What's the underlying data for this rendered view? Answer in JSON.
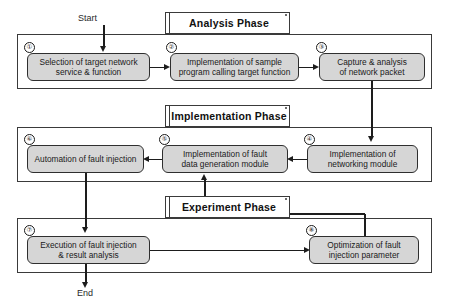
{
  "diagram": {
    "terminals": {
      "start": "Start",
      "end": "End"
    },
    "colors": {
      "box_fill": "#d6d6d6",
      "box_border": "#2f2f2f",
      "frame_border": "#3a3a3a",
      "connector": "#1d1d1d",
      "plaque_fill": "#ffffff",
      "text": "#1a1a1a"
    },
    "phases": [
      {
        "id": "analysis",
        "label": "Analysis Phase"
      },
      {
        "id": "implementation",
        "label": "Implementation Phase"
      },
      {
        "id": "experiment",
        "label": "Experiment Phase"
      }
    ],
    "steps": [
      {
        "number": "①",
        "phase": "analysis",
        "line1": "Selection of target network",
        "line2": "service & function"
      },
      {
        "number": "②",
        "phase": "analysis",
        "line1": "Implementation of sample",
        "line2": "program calling target function"
      },
      {
        "number": "③",
        "phase": "analysis",
        "line1": "Capture & analysis",
        "line2": "of network packet"
      },
      {
        "number": "④",
        "phase": "implementation",
        "line1": "Implementation of",
        "line2": "networking module"
      },
      {
        "number": "⑤",
        "phase": "implementation",
        "line1": "Implementation of fault",
        "line2": "data generation module"
      },
      {
        "number": "⑥",
        "phase": "implementation",
        "line1": "Automation of fault injection",
        "line2": ""
      },
      {
        "number": "⑦",
        "phase": "experiment",
        "line1": "Execution of fault injection",
        "line2": "& result analysis"
      },
      {
        "number": "⑧",
        "phase": "experiment",
        "line1": "Optimization of fault",
        "line2": "injection parameter"
      }
    ]
  }
}
